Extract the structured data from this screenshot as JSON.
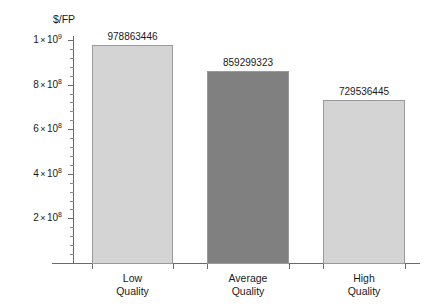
{
  "chart_data": {
    "type": "bar",
    "title": "",
    "subtitle": "",
    "xlabel": "",
    "ylabel": "$/FP",
    "categories": [
      "Low\nQuality",
      "Average\nQuality",
      "High\nQuality"
    ],
    "category_lines": [
      [
        "Low",
        "Quality"
      ],
      [
        "Average",
        "Quality"
      ],
      [
        "High",
        "Quality"
      ]
    ],
    "values": [
      978863446,
      859299323,
      729536445
    ],
    "value_labels": [
      "978863446",
      "859299323",
      "729536445"
    ],
    "bar_colors": [
      "#d4d4d4",
      "#808080",
      "#d4d4d4"
    ],
    "bar_border_color": "#9a9a9a",
    "ylim": [
      0,
      1050000000
    ],
    "yticks": [
      200000000,
      400000000,
      600000000,
      800000000,
      1000000000
    ],
    "ytick_labels": [
      {
        "mantissa": "2",
        "times": "×",
        "base": "10",
        "exponent": "8"
      },
      {
        "mantissa": "4",
        "times": "×",
        "base": "10",
        "exponent": "8"
      },
      {
        "mantissa": "6",
        "times": "×",
        "base": "10",
        "exponent": "8"
      },
      {
        "mantissa": "8",
        "times": "×",
        "base": "10",
        "exponent": "8"
      },
      {
        "mantissa": "1",
        "times": "×",
        "base": "10",
        "exponent": "9"
      }
    ],
    "minor_ticks_per_interval": 4,
    "grid": false,
    "legend": false,
    "axis_color": "#6b6b6b",
    "background": "#ffffff"
  }
}
